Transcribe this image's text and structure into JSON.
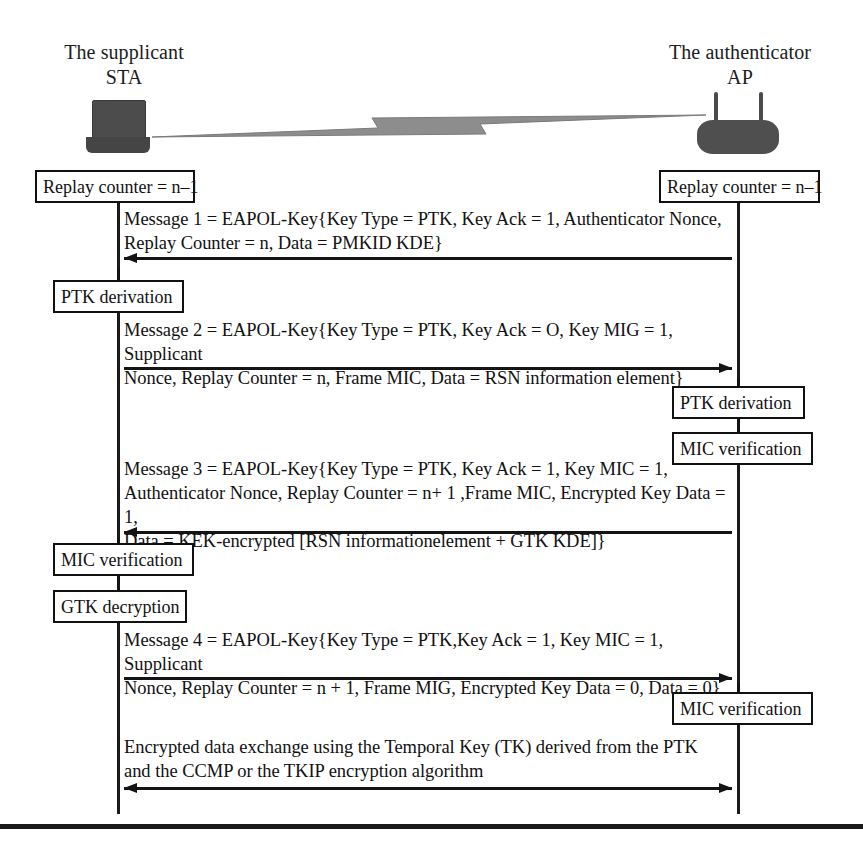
{
  "diagram": {
    "parties": {
      "left": {
        "name": "The supplicant\nSTA",
        "device_icon": "laptop-icon"
      },
      "right": {
        "name": "The authenticator\nAP",
        "device_icon": "wireless-router-icon"
      }
    },
    "wireless_link_icon": "wireless-lightning-icon",
    "notes": {
      "replay_counter_left": "Replay counter = n–1",
      "replay_counter_right": "Replay counter = n–1",
      "ptk_derivation_left": "PTK derivation",
      "ptk_derivation_right": "PTK derivation",
      "mic_verification_right_1": "MIC verification",
      "mic_verification_left": "MIC verification",
      "gtk_decryption_left": "GTK decryption",
      "mic_verification_right_2": "MIC verification"
    },
    "messages": [
      {
        "id": "message-1",
        "direction": "right-to-left",
        "text": "Message 1 = EAPOL-Key{Key Type = PTK, Key Ack = 1, Authenticator Nonce,\nReplay Counter = n, Data = PMKID KDE}"
      },
      {
        "id": "message-2",
        "direction": "left-to-right",
        "text": "Message 2 = EAPOL-Key{Key Type = PTK, Key Ack = O, Key MIG = 1, Supplicant\nNonce, Replay Counter = n, Frame MIC, Data = RSN information element}"
      },
      {
        "id": "message-3",
        "direction": "right-to-left",
        "text": "Message 3 = EAPOL-Key{Key Type = PTK, Key Ack = 1, Key MIC = 1,\nAuthenticator Nonce, Replay Counter = n+ 1 ,Frame MIC, Encrypted Key Data = 1,\nData = KEK-encrypted [RSN informationelement + GTK KDE]}"
      },
      {
        "id": "message-4",
        "direction": "left-to-right",
        "text": "Message 4 = EAPOL-Key{Key Type = PTK,Key Ack = 1, Key MIC = 1, Supplicant\nNonce, Replay Counter = n + 1, Frame MIG, Encrypted Key Data = 0, Data = 0}"
      },
      {
        "id": "data-exchange",
        "direction": "bidirectional",
        "text": "Encrypted data exchange using the Temporal Key (TK) derived from the PTK\nand the CCMP or the TKIP encryption algorithm"
      }
    ],
    "colors": {
      "ink": "#111111",
      "device": "#4c4c4c",
      "background": "#ffffff"
    }
  }
}
